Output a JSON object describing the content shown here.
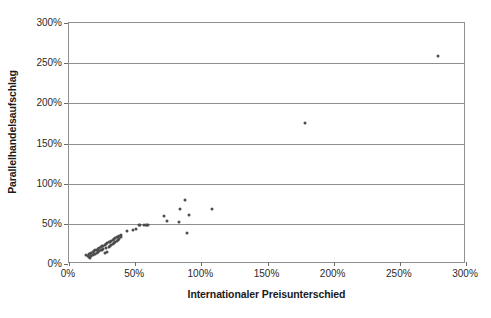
{
  "chart_data": {
    "type": "scatter",
    "title": "",
    "xlabel": "Internationaler Preisunterschied",
    "ylabel": "Parallelhandelsaufschlag",
    "xlim": [
      0,
      300
    ],
    "ylim": [
      0,
      300
    ],
    "xticks": [
      "0%",
      "50%",
      "100%",
      "150%",
      "200%",
      "250%",
      "300%"
    ],
    "xtick_values": [
      0,
      50,
      100,
      150,
      200,
      250,
      300
    ],
    "yticks": [
      "0%",
      "50%",
      "100%",
      "150%",
      "200%",
      "250%",
      "300%"
    ],
    "ytick_values": [
      0,
      50,
      100,
      150,
      200,
      250,
      300
    ],
    "grid": "horizontal",
    "legend": null,
    "unit": "%",
    "marker_color": "#4d4d4d",
    "axis_color": "#8f8f8f",
    "series": [
      {
        "name": "Parallelhandel",
        "points": [
          [
            13,
            11
          ],
          [
            14,
            10
          ],
          [
            15,
            12
          ],
          [
            15,
            9
          ],
          [
            16,
            13
          ],
          [
            16,
            8
          ],
          [
            17,
            14
          ],
          [
            17,
            10
          ],
          [
            18,
            15
          ],
          [
            18,
            11
          ],
          [
            19,
            16
          ],
          [
            19,
            12
          ],
          [
            20,
            17
          ],
          [
            20,
            13
          ],
          [
            21,
            18
          ],
          [
            21,
            14
          ],
          [
            22,
            19
          ],
          [
            22,
            15
          ],
          [
            23,
            20
          ],
          [
            23,
            16
          ],
          [
            24,
            21
          ],
          [
            24,
            17
          ],
          [
            25,
            22
          ],
          [
            25,
            18
          ],
          [
            26,
            23
          ],
          [
            26,
            19
          ],
          [
            27,
            24
          ],
          [
            27,
            14
          ],
          [
            28,
            25
          ],
          [
            28,
            20
          ],
          [
            29,
            26
          ],
          [
            29,
            15
          ],
          [
            30,
            27
          ],
          [
            30,
            21
          ],
          [
            31,
            28
          ],
          [
            31,
            22
          ],
          [
            32,
            29
          ],
          [
            32,
            24
          ],
          [
            33,
            30
          ],
          [
            33,
            25
          ],
          [
            34,
            31
          ],
          [
            34,
            26
          ],
          [
            35,
            32
          ],
          [
            35,
            27
          ],
          [
            36,
            33
          ],
          [
            36,
            29
          ],
          [
            37,
            34
          ],
          [
            37,
            30
          ],
          [
            38,
            35
          ],
          [
            38,
            31
          ],
          [
            39,
            36
          ],
          [
            39,
            33
          ],
          [
            44,
            41
          ],
          [
            48,
            42
          ],
          [
            51,
            43
          ],
          [
            53,
            48
          ],
          [
            54,
            49
          ],
          [
            57,
            48
          ],
          [
            58,
            49
          ],
          [
            59,
            49
          ],
          [
            60,
            49
          ],
          [
            72,
            60
          ],
          [
            74,
            53
          ],
          [
            83,
            52
          ],
          [
            84,
            68
          ],
          [
            88,
            80
          ],
          [
            89,
            39
          ],
          [
            91,
            61
          ],
          [
            108,
            69
          ],
          [
            178,
            175
          ],
          [
            279,
            259
          ]
        ]
      }
    ]
  }
}
